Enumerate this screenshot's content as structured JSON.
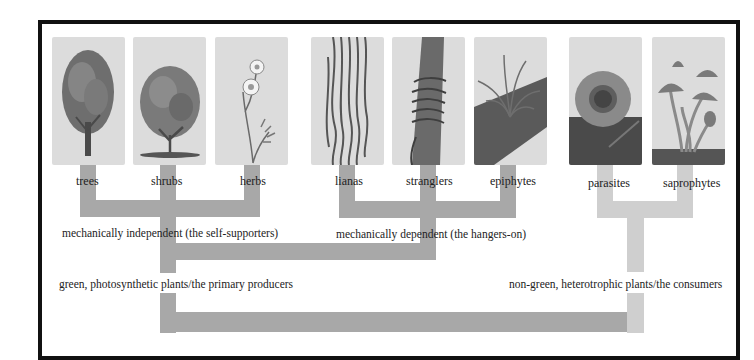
{
  "diagram": {
    "type": "tree-classification",
    "colors": {
      "frame": "#111111",
      "green_branch": "#a8a8a8",
      "consumer_branch": "#cfcfcf",
      "panel_bg": "#dcdcdc"
    },
    "leaves": [
      {
        "id": "trees",
        "label": "trees",
        "icon": "tree-icon"
      },
      {
        "id": "shrubs",
        "label": "shrubs",
        "icon": "shrub-icon"
      },
      {
        "id": "herbs",
        "label": "herbs",
        "icon": "daisy-herb-icon"
      },
      {
        "id": "lianas",
        "label": "lianas",
        "icon": "liana-vines-icon"
      },
      {
        "id": "stranglers",
        "label": "stranglers",
        "icon": "strangler-fig-icon"
      },
      {
        "id": "epiphytes",
        "label": "epiphytes",
        "icon": "epiphyte-bromeliad-icon"
      },
      {
        "id": "parasites",
        "label": "parasites",
        "icon": "rafflesia-flower-icon"
      },
      {
        "id": "saprophytes",
        "label": "saprophytes",
        "icon": "mushroom-icon"
      }
    ],
    "groups": {
      "independent": "mechanically independent (the self-supporters)",
      "dependent": "mechanically dependent (the hangers-on)",
      "producers": "green, photosynthetic plants/the primary producers",
      "consumers": "non-green, heterotrophic plants/the consumers"
    }
  }
}
